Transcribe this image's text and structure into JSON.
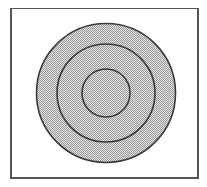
{
  "figure": {
    "title": "Concentric circles diagram",
    "canvas": {
      "width": 207,
      "height": 187,
      "background": "#ffffff"
    },
    "frame": {
      "name": "outer-frame",
      "x": 11,
      "y": 8.5,
      "width": 187,
      "height": 169.5,
      "stroke": "#555555",
      "stroke_width": 1.4,
      "fill": "#ffffff"
    },
    "center": {
      "cx": 106,
      "cy": 93
    },
    "fill_color": "#d2d2d2",
    "halftone": {
      "description": "dithered gray stipple fill",
      "dot_color": "#9a9a9a",
      "base_color": "#e2e2e2",
      "cell_size": 2
    },
    "circles": [
      {
        "name": "outer-circle",
        "label": "Outer circle",
        "radius": 69.5,
        "stroke": "#3a3a3a",
        "stroke_width": 1.6,
        "filled": true
      },
      {
        "name": "middle-circle",
        "label": "Middle circle",
        "radius": 49,
        "stroke": "#3a3a3a",
        "stroke_width": 1.6,
        "filled": true
      },
      {
        "name": "inner-circle",
        "label": "Inner circle",
        "radius": 24,
        "stroke": "#3a3a3a",
        "stroke_width": 1.6,
        "filled": true
      }
    ]
  }
}
